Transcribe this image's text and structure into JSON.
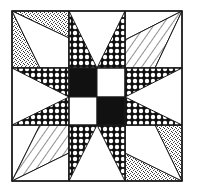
{
  "figure": {
    "title": "Quilt block pattern",
    "colors": {
      "background": "#ffffff",
      "outline": "#1a1a1a",
      "solid": "#111111",
      "fabric_white": "#ffffff"
    },
    "grid": {
      "rows": 3,
      "cols": 3
    },
    "center": {
      "quadrants": [
        "black",
        "white",
        "white",
        "black"
      ]
    },
    "fabrics": [
      "circles",
      "stipple",
      "stripes",
      "solid-black",
      "white"
    ]
  }
}
